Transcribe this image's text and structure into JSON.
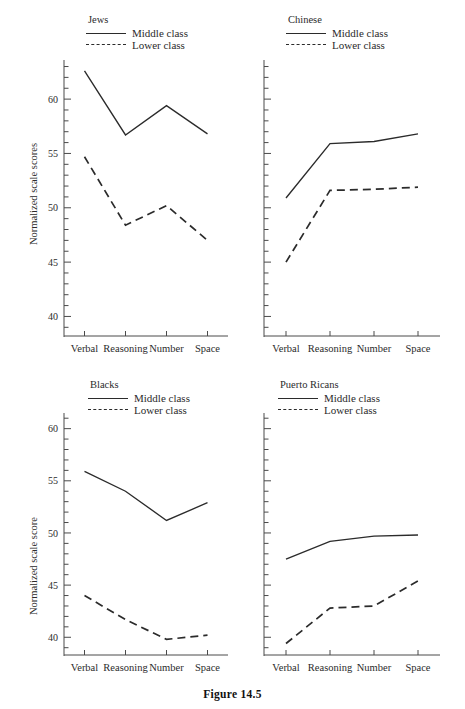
{
  "figure": {
    "caption": "Figure 14.5"
  },
  "legend": {
    "middle_label": "Middle class",
    "lower_label": "Lower class",
    "middle_swatch": "solid-line-swatch",
    "lower_swatch": "dashed-line-swatch"
  },
  "axis": {
    "ylabel_plural": "Normalized scale scores",
    "ylabel_singular": "Normalized scale score",
    "categories": [
      "Verbal",
      "Reasoning",
      "Number",
      "Space"
    ],
    "yticks_labeled": [
      40,
      45,
      50,
      55,
      60
    ],
    "ytick_labels": [
      "40",
      "45",
      "50",
      "55",
      "60"
    ]
  },
  "chart_data": [
    {
      "type": "line",
      "title": "Jews",
      "panel": "top-left",
      "xlabel": "",
      "ylabel": "Normalized scale scores",
      "categories": [
        "Verbal",
        "Reasoning",
        "Number",
        "Space"
      ],
      "ylim": [
        38.2,
        63.6
      ],
      "yticks": [
        40,
        45,
        50,
        55,
        60
      ],
      "ytick_labels": [
        "40",
        "45",
        "50",
        "55",
        "60"
      ],
      "minor_tick_step": 1,
      "grid": false,
      "legend_position": "top-center",
      "series": [
        {
          "name": "Middle class",
          "style": "solid",
          "values": [
            62.6,
            56.7,
            59.4,
            56.8
          ]
        },
        {
          "name": "Lower class",
          "style": "dashed",
          "values": [
            54.7,
            48.4,
            50.2,
            47.0
          ]
        }
      ]
    },
    {
      "type": "line",
      "title": "Chinese",
      "panel": "top-right",
      "xlabel": "",
      "ylabel": "",
      "categories": [
        "Verbal",
        "Reasoning",
        "Number",
        "Space"
      ],
      "ylim": [
        38.2,
        63.6
      ],
      "yticks": [
        40,
        45,
        50,
        55,
        60
      ],
      "ytick_labels": [],
      "minor_tick_step": 1,
      "grid": false,
      "legend_position": "top-center",
      "series": [
        {
          "name": "Middle class",
          "style": "solid",
          "values": [
            50.9,
            55.9,
            56.1,
            56.8
          ]
        },
        {
          "name": "Lower class",
          "style": "dashed",
          "values": [
            45.0,
            51.6,
            51.7,
            51.9
          ]
        }
      ]
    },
    {
      "type": "line",
      "title": "Blacks",
      "panel": "bottom-left",
      "xlabel": "",
      "ylabel": "Normalized scale score",
      "categories": [
        "Verbal",
        "Reasoning",
        "Number",
        "Space"
      ],
      "ylim": [
        38.3,
        61.5
      ],
      "yticks": [
        40,
        45,
        50,
        55,
        60
      ],
      "ytick_labels": [
        "40",
        "45",
        "50",
        "55",
        "60"
      ],
      "minor_tick_step": 1,
      "grid": false,
      "legend_position": "top-center",
      "series": [
        {
          "name": "Middle class",
          "style": "solid",
          "values": [
            55.9,
            54.0,
            51.2,
            52.9
          ]
        },
        {
          "name": "Lower class",
          "style": "dashed",
          "values": [
            44.0,
            41.7,
            39.8,
            40.2
          ]
        }
      ]
    },
    {
      "type": "line",
      "title": "Puerto Ricans",
      "panel": "bottom-right",
      "xlabel": "",
      "ylabel": "",
      "categories": [
        "Verbal",
        "Reasoning",
        "Number",
        "Space"
      ],
      "ylim": [
        38.3,
        61.5
      ],
      "yticks": [
        40,
        45,
        50,
        55,
        60
      ],
      "ytick_labels": [],
      "minor_tick_step": 1,
      "grid": false,
      "legend_position": "top-center",
      "series": [
        {
          "name": "Middle class",
          "style": "solid",
          "values": [
            47.5,
            49.2,
            49.7,
            49.8
          ]
        },
        {
          "name": "Lower class",
          "style": "dashed",
          "values": [
            39.4,
            42.8,
            43.0,
            45.4
          ]
        }
      ]
    }
  ],
  "panels": {
    "top_left_title": "Jews",
    "top_right_title": "Chinese",
    "bottom_left_title": "Blacks",
    "bottom_right_title": "Puerto Ricans"
  }
}
